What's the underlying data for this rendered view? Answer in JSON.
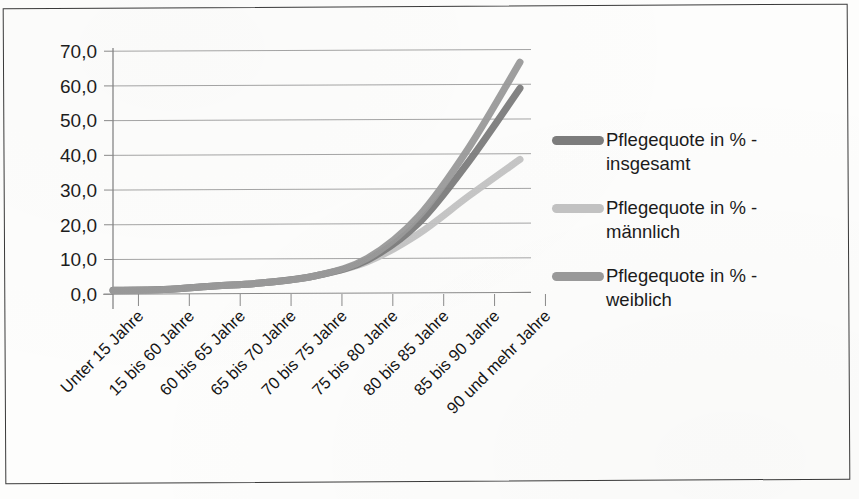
{
  "document": {
    "kind": "scanned-chart-page",
    "border_color": "#3a3a3a",
    "background": "#fdfdfc"
  },
  "chart_data": {
    "type": "line",
    "title": "",
    "subtitle": "",
    "xlabel": "",
    "ylabel": "",
    "ylim": [
      0,
      70
    ],
    "ytick_step": 10,
    "grid": true,
    "grid_axis": "y",
    "legend_position": "right",
    "decimal_separator": ",",
    "categories": [
      "Unter 15 Jahre",
      "15 bis 60 Jahre",
      "60 bis 65 Jahre",
      "65 bis 70 Jahre",
      "70 bis 75 Jahre",
      "75 bis 80 Jahre",
      "80 bis 85 Jahre",
      "85 bis 90 Jahre",
      "90 und mehr Jahre"
    ],
    "ytick_labels": [
      "0,0",
      "10,0",
      "20,0",
      "30,0",
      "40,0",
      "50,0",
      "60,0",
      "70,0"
    ],
    "ytick_values": [
      0,
      10,
      20,
      30,
      40,
      50,
      60,
      70
    ],
    "series": [
      {
        "name": "Pflegequote in % - insgesamt",
        "label_line1": "Pflegequote in % -",
        "label_line2": "insgesamt",
        "color": "#7c7c7c",
        "values": [
          0.8,
          1.0,
          2.0,
          3.0,
          5.0,
          9.5,
          20.0,
          38.0,
          59.0
        ]
      },
      {
        "name": "Pflegequote in % - männlich",
        "label_line1": "Pflegequote in % -",
        "label_line2": "männlich",
        "color": "#c3c3c3",
        "values": [
          0.8,
          1.0,
          2.0,
          3.0,
          5.0,
          9.0,
          17.0,
          28.0,
          38.5
        ]
      },
      {
        "name": "Pflegequote in % - weiblich",
        "label_line1": "Pflegequote in % -",
        "label_line2": "weiblich",
        "color": "#9a9a9a",
        "values": [
          0.7,
          1.0,
          2.0,
          3.0,
          5.0,
          10.0,
          22.0,
          42.0,
          66.5
        ]
      }
    ]
  }
}
